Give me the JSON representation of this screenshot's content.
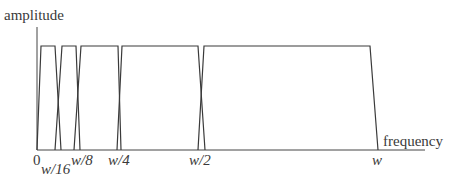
{
  "diagram": {
    "axes": {
      "y_label": "amplitude",
      "x_label": "frequency"
    },
    "ticks": [
      {
        "label": "0",
        "x": 37
      },
      {
        "label": "w/16",
        "x": 52
      },
      {
        "label": "w/8",
        "x": 80
      },
      {
        "label": "w/4",
        "x": 120
      },
      {
        "label": "w/2",
        "x": 201
      },
      {
        "label": "w",
        "x": 377
      }
    ],
    "bands": [
      {
        "name": "band-1",
        "points": "37,150 41,46 55,46 61,150"
      },
      {
        "name": "band-2",
        "points": "55,150 62,46 76,46 80,150"
      },
      {
        "name": "band-3",
        "points": "74,150 81,46 118,46 121,150"
      },
      {
        "name": "band-4",
        "points": "117,150 122,46 198,46 205,150"
      },
      {
        "name": "band-5",
        "points": "198,150 204,46 370,46 378,150"
      }
    ],
    "line_color": "#3a3a3a"
  }
}
